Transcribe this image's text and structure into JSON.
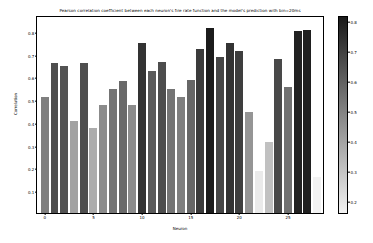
{
  "chart_data": {
    "type": "bar",
    "title": "Pearson correlation coefficient between each neuron's fire rate function and the model's prediction with bin=20ms",
    "xlabel": "Neuron",
    "ylabel": "Correlation",
    "categories": [
      0,
      1,
      2,
      3,
      4,
      5,
      6,
      7,
      8,
      9,
      10,
      11,
      12,
      13,
      14,
      15,
      16,
      17,
      18,
      19,
      20,
      21,
      22,
      23,
      24,
      25,
      26,
      27,
      28
    ],
    "values": [
      0.51,
      0.66,
      0.645,
      0.405,
      0.66,
      0.375,
      0.475,
      0.545,
      0.58,
      0.475,
      0.745,
      0.625,
      0.665,
      0.545,
      0.51,
      0.585,
      0.72,
      0.815,
      0.685,
      0.745,
      0.71,
      0.445,
      0.185,
      0.31,
      0.675,
      0.555,
      0.8,
      0.805,
      0.16
    ],
    "xtick_labels": [
      "0",
      "5",
      "10",
      "15",
      "20",
      "25"
    ],
    "xtick_values": [
      0,
      5,
      10,
      15,
      20,
      25
    ],
    "ytick_labels": [
      "0.1",
      "0.2",
      "0.3",
      "0.4",
      "0.5",
      "0.6",
      "0.7",
      "0.8"
    ],
    "ytick_values": [
      0.1,
      0.2,
      0.3,
      0.4,
      0.5,
      0.6,
      0.7,
      0.8
    ],
    "ylim": [
      0.0,
      0.87
    ],
    "xlim": [
      -0.8,
      28.8
    ],
    "grid": false,
    "legend": "none",
    "colormap": "gray_reversed",
    "colorbar": {
      "tick_labels": [
        "0.2",
        "0.3",
        "0.4",
        "0.5",
        "0.6",
        "0.7",
        "0.8"
      ],
      "tick_values": [
        0.2,
        0.3,
        0.4,
        0.5,
        0.6,
        0.7,
        0.8
      ],
      "vmin": 0.16,
      "vmax": 0.82,
      "top_color": "#1a1a1a",
      "bottom_color": "#f2f2f2",
      "orientation": "vertical"
    }
  }
}
